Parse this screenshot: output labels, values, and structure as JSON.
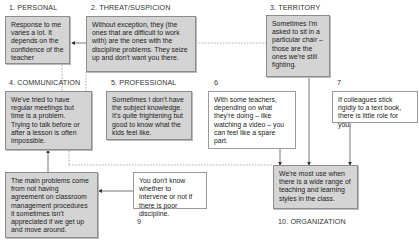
{
  "diagram": {
    "categories": [
      {
        "id": "1",
        "label": "1. PERSONAL"
      },
      {
        "id": "2",
        "label": "2. THREAT/SUSPICION"
      },
      {
        "id": "3",
        "label": "3. TERRITORY"
      },
      {
        "id": "4",
        "label": "4. COMMUNICATION"
      },
      {
        "id": "5",
        "label": "5. PROFESSIONAL"
      },
      {
        "id": "6",
        "label": "6"
      },
      {
        "id": "7",
        "label": "7"
      },
      {
        "id": "9",
        "label": "9"
      },
      {
        "id": "10",
        "label": "10. ORGANIZATION"
      }
    ],
    "boxes": {
      "personal": "Response to me varies a lot. It depends on the confidence of the teacher",
      "threat": "Without exception, they (the ones that are difficult to work with) are the ones with the discipline problems. They seize up and don't want you there.",
      "territory": "Sometimes I'm asked to sit in a particular chair – those are the ones we're still fighting.",
      "communication": "We've tried to have regular meetings but time is a problem. Trying to talk before or after a lesson is often impossible.",
      "professional": "Sometimes I don't have the subject knowledge. It's quite frightening but good to know what the kids feel like.",
      "six": "With some teachers, depending on what they're doing – like watching a video – you can feel like a spare part.",
      "seven": "If colleagues stick rigidly to a text book, there is little role for you.",
      "main_problems": "The main problems come from not having agreement on classroom management procedures it sometimes isn't appreciated if we get up and move around.",
      "nine": "You don't know whether to intervene or not if there is poor discipline.",
      "organization": "We're most use when there is a wide range of teaching and learning styles in the class."
    },
    "colors": {
      "grey_box": "#d4d4d4",
      "line": "#555555"
    }
  }
}
